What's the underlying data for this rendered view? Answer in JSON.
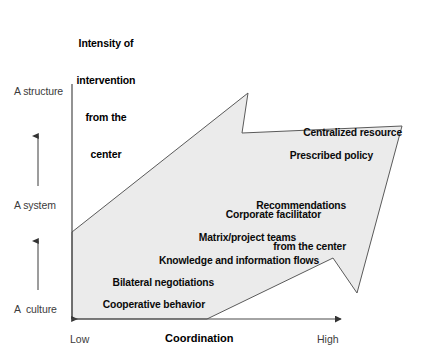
{
  "diagram": {
    "type": "arrow-continuum",
    "y_axis": {
      "title": "Intensity of\nintervention\nfrom the\ncenter",
      "title_lines": [
        "Intensity of",
        "intervention",
        "from the",
        "center"
      ],
      "stages": [
        {
          "label": "A structure",
          "name": "stage-structure"
        },
        {
          "label": "A system",
          "name": "stage-system"
        },
        {
          "label": "A  culture",
          "name": "stage-culture"
        }
      ]
    },
    "x_axis": {
      "title": "Coordination",
      "low_label": "Low",
      "high_label": "High"
    },
    "bands": [
      {
        "text": "Centralized resource",
        "lines": [
          "Centralized resource"
        ]
      },
      {
        "text": "Prescribed policy",
        "lines": [
          "Prescribed policy"
        ]
      },
      {
        "text": "Recommendations from the center",
        "lines": [
          "Recommendations",
          "from the center"
        ]
      },
      {
        "text": "Corporate facilitator",
        "lines": [
          "Corporate facilitator"
        ]
      },
      {
        "text": "Matrix/project teams",
        "lines": [
          "Matrix/project teams"
        ]
      },
      {
        "text": "Knowledge and information flows",
        "lines": [
          "Knowledge and information flows"
        ]
      },
      {
        "text": "Bilateral negotiations",
        "lines": [
          "Bilateral negotiations"
        ]
      },
      {
        "text": "Cooperative behavior",
        "lines": [
          "Cooperative behavior"
        ]
      }
    ],
    "colors": {
      "arrow_fill": "#ebebeb",
      "arrow_stroke": "#555555",
      "axis_line": "#4a4a4a",
      "text": "#000000",
      "muted_text": "#3b3b3b"
    }
  }
}
